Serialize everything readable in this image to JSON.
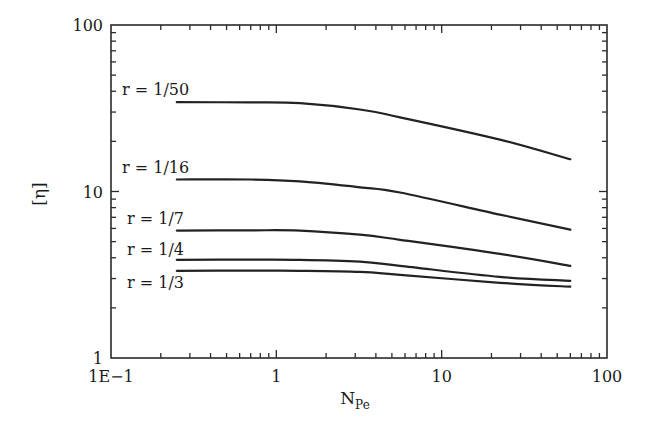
{
  "chart_data": {
    "type": "line",
    "title": "",
    "xlabel": "N",
    "xlabel_subscript": "Pe",
    "ylabel": "[η]",
    "xscale": "log",
    "yscale": "log",
    "xlim": [
      0.1,
      100
    ],
    "ylim": [
      1,
      100
    ],
    "grid": false,
    "legend": "none",
    "x_tick_labels": [
      {
        "value": 0.1,
        "label": "1E−1"
      },
      {
        "value": 1,
        "label": "1"
      },
      {
        "value": 10,
        "label": "10"
      },
      {
        "value": 100,
        "label": "100"
      }
    ],
    "y_tick_labels": [
      {
        "value": 1,
        "label": "1"
      },
      {
        "value": 10,
        "label": "10"
      },
      {
        "value": 100,
        "label": "100"
      }
    ],
    "x": [
      0.25,
      0.7,
      1.39,
      3.2,
      5.6,
      22.5,
      60
    ],
    "series": [
      {
        "name": "r = 1/50",
        "values": [
          34.4,
          34.3,
          33.9,
          31.1,
          27.9,
          20.5,
          15.6
        ]
      },
      {
        "name": "r = 1/16",
        "values": [
          11.8,
          11.8,
          11.5,
          10.6,
          9.86,
          7.27,
          5.9
        ]
      },
      {
        "name": "r = 1/7",
        "values": [
          5.82,
          5.85,
          5.82,
          5.5,
          5.13,
          4.22,
          3.58
        ]
      },
      {
        "name": "r = 1/4",
        "values": [
          3.89,
          3.9,
          3.89,
          3.79,
          3.58,
          3.07,
          2.91
        ]
      },
      {
        "name": "r = 1/3",
        "values": [
          3.34,
          3.35,
          3.34,
          3.29,
          3.16,
          2.83,
          2.68
        ]
      }
    ]
  }
}
